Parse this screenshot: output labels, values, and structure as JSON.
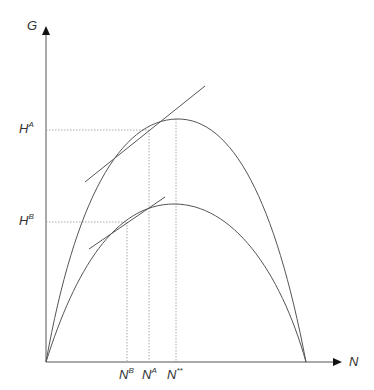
{
  "diagram": {
    "y_axis_label": "G",
    "x_axis_label": "N",
    "y_ticks": [
      {
        "base": "H",
        "sup": "A"
      },
      {
        "base": "H",
        "sup": "B"
      }
    ],
    "x_ticks": [
      {
        "base": "N",
        "sup": "B"
      },
      {
        "base": "N",
        "sup": "A"
      },
      {
        "base": "N",
        "sup": "**"
      }
    ],
    "curves": [
      {
        "name": "upper-growth-curve",
        "peak_label": "N**",
        "tangent_point": "A"
      },
      {
        "name": "lower-growth-curve",
        "peak_label": "N**",
        "tangent_point": "B"
      }
    ],
    "colors": {
      "curve": "#555555",
      "axis": "#555555",
      "guide": "#aaaaaa",
      "text": "#333333"
    }
  }
}
